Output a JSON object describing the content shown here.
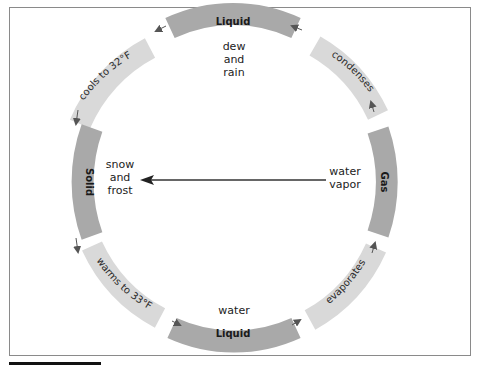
{
  "diagram": {
    "states": [
      {
        "id": "liquid-top",
        "label": "Liquid",
        "caption": [
          "dew",
          "and",
          "rain"
        ]
      },
      {
        "id": "solid",
        "label": "Solid",
        "caption": [
          "snow",
          "and",
          "frost"
        ]
      },
      {
        "id": "liquid-bottom",
        "label": "Liquid",
        "caption": [
          "water"
        ]
      },
      {
        "id": "gas",
        "label": "Gas",
        "caption": [
          "water",
          "vapor"
        ]
      }
    ],
    "transitions": [
      {
        "id": "cools",
        "label": "cools to 32°F",
        "from": "liquid-top",
        "to": "solid"
      },
      {
        "id": "warms",
        "label": "warms to 33°F",
        "from": "solid",
        "to": "liquid-bottom"
      },
      {
        "id": "evaporates",
        "label": "evaporates",
        "from": "liquid-bottom",
        "to": "gas"
      },
      {
        "id": "condenses",
        "label": "condenses",
        "from": "gas",
        "to": "liquid-top"
      }
    ],
    "direct_arrow": {
      "from": "gas",
      "to": "solid"
    },
    "colors": {
      "state_band": "#a9a9a9",
      "transition_band": "#d9d9d9",
      "arrow": "#555555",
      "frame": "#8a8a8a"
    }
  }
}
